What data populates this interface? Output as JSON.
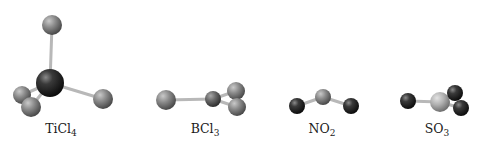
{
  "diagram": {
    "type": "ball-and-stick molecular models",
    "molecules": [
      {
        "id": "ticl4",
        "formula": "TiCl",
        "subscript": "4",
        "label_x": 61,
        "geometry": "tetrahedral",
        "atoms": [
          {
            "element": "Cl",
            "x": 52,
            "y": 25,
            "r": 10,
            "fill": "cl"
          },
          {
            "element": "Cl",
            "x": 22,
            "y": 95,
            "r": 9,
            "fill": "cl"
          },
          {
            "element": "Ti",
            "x": 50,
            "y": 83,
            "r": 14,
            "fill": "dark"
          },
          {
            "element": "Cl",
            "x": 31,
            "y": 107,
            "r": 10,
            "fill": "cl"
          },
          {
            "element": "Cl",
            "x": 103,
            "y": 99,
            "r": 10,
            "fill": "cl"
          }
        ],
        "bonds": [
          [
            2,
            0
          ],
          [
            2,
            1
          ],
          [
            2,
            3
          ],
          [
            2,
            4
          ]
        ]
      },
      {
        "id": "bcl3",
        "formula": "BCl",
        "subscript": "3",
        "label_x": 205,
        "geometry": "trigonal planar",
        "atoms": [
          {
            "element": "Cl",
            "x": 166,
            "y": 100,
            "r": 10,
            "fill": "cl"
          },
          {
            "element": "B",
            "x": 213,
            "y": 99,
            "r": 8,
            "fill": "boron"
          },
          {
            "element": "Cl",
            "x": 236,
            "y": 91,
            "r": 9,
            "fill": "cl"
          },
          {
            "element": "Cl",
            "x": 237,
            "y": 107,
            "r": 9,
            "fill": "cl"
          }
        ],
        "bonds": [
          [
            1,
            0
          ],
          [
            1,
            2
          ],
          [
            1,
            3
          ]
        ]
      },
      {
        "id": "no2",
        "formula": "NO",
        "subscript": "2",
        "label_x": 322,
        "geometry": "bent",
        "atoms": [
          {
            "element": "O",
            "x": 297,
            "y": 106,
            "r": 8,
            "fill": "dark"
          },
          {
            "element": "O",
            "x": 351,
            "y": 106,
            "r": 8,
            "fill": "dark"
          },
          {
            "element": "N",
            "x": 323,
            "y": 97,
            "r": 8,
            "fill": "cl"
          }
        ],
        "bonds": [
          [
            2,
            0
          ],
          [
            2,
            1
          ]
        ]
      },
      {
        "id": "so3",
        "formula": "SO",
        "subscript": "3",
        "label_x": 437,
        "geometry": "trigonal planar",
        "atoms": [
          {
            "element": "O",
            "x": 408,
            "y": 101,
            "r": 8,
            "fill": "dark"
          },
          {
            "element": "S",
            "x": 440,
            "y": 102,
            "r": 10,
            "fill": "sulfur"
          },
          {
            "element": "O",
            "x": 455,
            "y": 93,
            "r": 8,
            "fill": "dark"
          },
          {
            "element": "O",
            "x": 461,
            "y": 108,
            "r": 8,
            "fill": "dark"
          }
        ],
        "bonds": [
          [
            1,
            0
          ],
          [
            1,
            2
          ],
          [
            1,
            3
          ]
        ]
      }
    ],
    "colors": {
      "background": "#ffffff",
      "bond": "#b8b8b8",
      "label": "#1a1a1a"
    }
  }
}
